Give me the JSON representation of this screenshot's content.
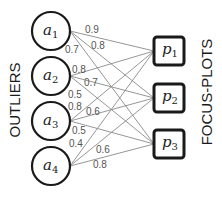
{
  "labels": {
    "left": "OUTLIERS",
    "right": "FOCUS-PLOTS"
  },
  "outliers": [
    {
      "id": "a1",
      "base": "a",
      "sub": "1",
      "cx": 51,
      "cy": 31
    },
    {
      "id": "a2",
      "base": "a",
      "sub": "2",
      "cx": 51,
      "cy": 76
    },
    {
      "id": "a3",
      "base": "a",
      "sub": "3",
      "cx": 51,
      "cy": 121
    },
    {
      "id": "a4",
      "base": "a",
      "sub": "4",
      "cx": 51,
      "cy": 166
    }
  ],
  "focus_plots": [
    {
      "id": "p1",
      "base": "p",
      "sub": "1",
      "x": 154,
      "y": 37,
      "cy": 51
    },
    {
      "id": "p2",
      "base": "p",
      "sub": "2",
      "x": 154,
      "y": 84,
      "cy": 98
    },
    {
      "id": "p3",
      "base": "p",
      "sub": "3",
      "x": 154,
      "y": 130,
      "cy": 144
    }
  ],
  "edges": [
    {
      "from": "a1",
      "to": "p1",
      "weight": "0.9",
      "lx": 85,
      "ly": 33
    },
    {
      "from": "a1",
      "to": "p2",
      "weight": "0.8",
      "lx": 91,
      "ly": 49
    },
    {
      "from": "a1",
      "to": "p3",
      "weight": "0.7",
      "lx": 65,
      "ly": 53
    },
    {
      "from": "a2",
      "to": "p1",
      "weight": "0.8",
      "lx": 72,
      "ly": 73
    },
    {
      "from": "a2",
      "to": "p2",
      "weight": "0.7",
      "lx": 84,
      "ly": 86
    },
    {
      "from": "a2",
      "to": "p3",
      "weight": "0.5",
      "lx": 68,
      "ly": 98
    },
    {
      "from": "a3",
      "to": "p1",
      "weight": "0.8",
      "lx": 68,
      "ly": 110
    },
    {
      "from": "a3",
      "to": "p2",
      "weight": "0.6",
      "lx": 86,
      "ly": 115
    },
    {
      "from": "a3",
      "to": "p3",
      "weight": "0.5",
      "lx": 72,
      "ly": 134
    },
    {
      "from": "a4",
      "to": "p1",
      "weight": "0.4",
      "lx": 69,
      "ly": 147
    },
    {
      "from": "a4",
      "to": "p2",
      "weight": "0.6",
      "lx": 96,
      "ly": 153
    },
    {
      "from": "a4",
      "to": "p3",
      "weight": "0.8",
      "lx": 93,
      "ly": 168
    }
  ]
}
